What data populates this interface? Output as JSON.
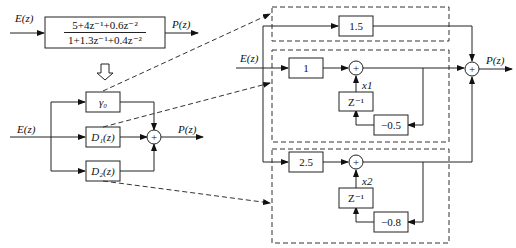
{
  "diagram": {
    "top": {
      "input_label": "E(z)",
      "output_label": "P(z)",
      "numerator": "5+4z⁻¹+0.6z⁻²",
      "denominator": "1+1.3z⁻¹+0.4z⁻²"
    },
    "arrow_down": "⇩",
    "parallel": {
      "input_label": "E(z)",
      "output_label": "P(z)",
      "blocks": [
        "γ₀",
        "D₁(z)",
        "D₂(z)"
      ],
      "sum_symbol": "+"
    },
    "expanded": {
      "input_label": "E(z)",
      "output_label": "P(z)",
      "gain_block": "1.5",
      "section1": {
        "input_gain": "1",
        "delay": "Z⁻¹",
        "state": "x1",
        "feedback": "−0.5"
      },
      "section2": {
        "input_gain": "2.5",
        "delay": "Z⁻¹",
        "state": "x2",
        "feedback": "−0.8"
      },
      "sum_symbol": "+"
    }
  }
}
